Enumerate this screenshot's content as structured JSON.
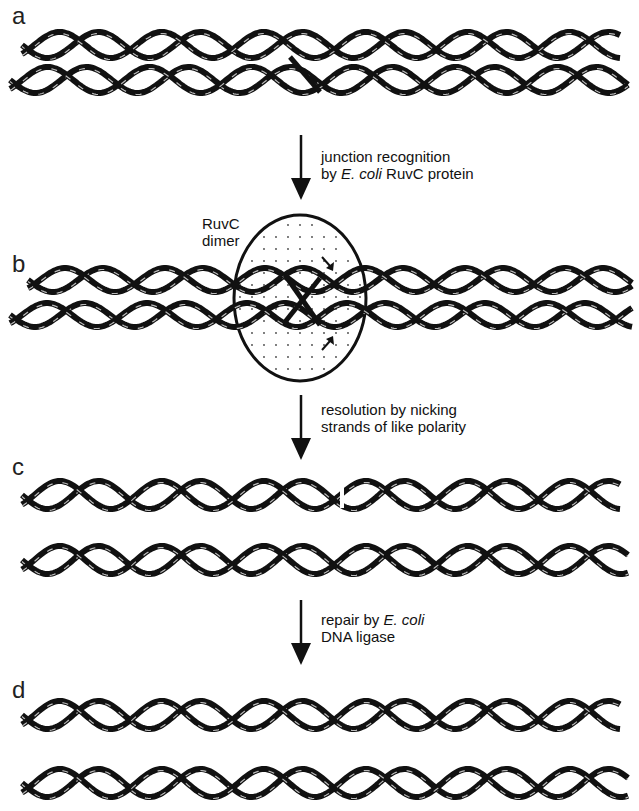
{
  "panels": [
    {
      "label": "a"
    },
    {
      "label": "b",
      "annotation_line1": "RuvC",
      "annotation_line2": "dimer"
    },
    {
      "label": "c"
    },
    {
      "label": "d"
    }
  ],
  "steps": [
    {
      "line1": "junction recognition",
      "line2_pre": "by ",
      "line2_italic": "E. coli",
      "line2_post": " RuvC protein"
    },
    {
      "line1": "resolution by nicking",
      "line2": "strands of like polarity"
    },
    {
      "line1_pre": "repair by ",
      "line1_italic": "E. coli",
      "line2": "DNA ligase"
    }
  ],
  "colors": {
    "ink": "#111111",
    "paper": "#ffffff",
    "dots": "#444444"
  }
}
